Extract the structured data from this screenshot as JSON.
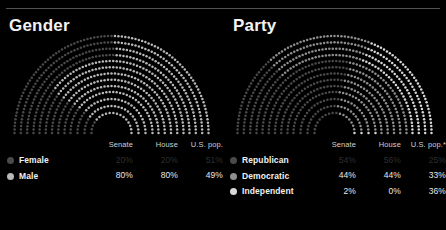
{
  "background": "#000000",
  "rule_color": "#6e6e6e",
  "panels": [
    {
      "id": "gender",
      "title": "Gender",
      "columns": [
        "Senate",
        "House",
        "U.S. pop."
      ],
      "name_header": "",
      "rows": [
        {
          "label": "Female",
          "swatch_icon": "legend-dot-icon",
          "color": "#4a4a4a",
          "dim": true,
          "values": [
            "20%",
            "20%",
            "51%"
          ]
        },
        {
          "label": "Male",
          "swatch_icon": "legend-dot-icon",
          "color": "#b9b9b9",
          "dim": false,
          "values": [
            "80%",
            "80%",
            "49%"
          ]
        }
      ]
    },
    {
      "id": "party",
      "title": "Party",
      "columns": [
        "Senate",
        "House",
        "U.S. pop.*"
      ],
      "name_header": "",
      "rows": [
        {
          "label": "Republican",
          "swatch_icon": "legend-dot-icon",
          "color": "#4a4a4a",
          "dim": true,
          "values": [
            "54%",
            "56%",
            "25%"
          ]
        },
        {
          "label": "Democratic",
          "swatch_icon": "legend-dot-icon",
          "color": "#8f8f8f",
          "dim": false,
          "values": [
            "44%",
            "44%",
            "33%"
          ]
        },
        {
          "label": "Independent",
          "swatch_icon": "legend-dot-icon",
          "color": "#d8d8d8",
          "dim": false,
          "values": [
            "2%",
            "0%",
            "36%"
          ]
        }
      ]
    }
  ],
  "chart_data": [
    {
      "type": "pie",
      "title": "Gender",
      "variant": "nested-semicircular-dot-arc",
      "legend_position": "bottom",
      "bands": [
        {
          "name": "Senate",
          "ring": "inner",
          "categories": [
            "Female",
            "Male"
          ],
          "values": [
            20,
            80
          ]
        },
        {
          "name": "House",
          "ring": "middle",
          "categories": [
            "Female",
            "Male"
          ],
          "values": [
            20,
            80
          ]
        },
        {
          "name": "U.S. pop.",
          "ring": "outer",
          "categories": [
            "Female",
            "Male"
          ],
          "values": [
            51,
            49
          ]
        }
      ],
      "categories": [
        "Female",
        "Male"
      ],
      "series": [
        {
          "name": "Senate",
          "values": [
            20,
            80
          ]
        },
        {
          "name": "House",
          "values": [
            20,
            80
          ]
        },
        {
          "name": "U.S. pop.",
          "values": [
            51,
            49
          ]
        }
      ],
      "colors": [
        "#4a4a4a",
        "#b9b9b9"
      ],
      "xlabel": "",
      "ylabel": "",
      "units": "percent"
    },
    {
      "type": "pie",
      "title": "Party",
      "variant": "nested-semicircular-dot-arc",
      "legend_position": "bottom",
      "bands": [
        {
          "name": "Senate",
          "ring": "inner",
          "categories": [
            "Republican",
            "Democratic",
            "Independent"
          ],
          "values": [
            54,
            44,
            2
          ]
        },
        {
          "name": "House",
          "ring": "middle",
          "categories": [
            "Republican",
            "Democratic",
            "Independent"
          ],
          "values": [
            56,
            44,
            0
          ]
        },
        {
          "name": "U.S. pop.*",
          "ring": "outer",
          "categories": [
            "Republican",
            "Democratic",
            "Independent"
          ],
          "values": [
            25,
            33,
            36
          ]
        }
      ],
      "categories": [
        "Republican",
        "Democratic",
        "Independent"
      ],
      "series": [
        {
          "name": "Senate",
          "values": [
            54,
            44,
            2
          ]
        },
        {
          "name": "House",
          "values": [
            56,
            44,
            0
          ]
        },
        {
          "name": "U.S. pop.*",
          "values": [
            25,
            33,
            36
          ]
        }
      ],
      "colors": [
        "#4a4a4a",
        "#8f8f8f",
        "#d8d8d8"
      ],
      "xlabel": "",
      "ylabel": "",
      "units": "percent"
    }
  ]
}
